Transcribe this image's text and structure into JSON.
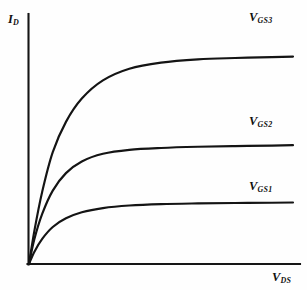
{
  "figure": {
    "background_color": "#fefefe",
    "line_color": "#141414"
  },
  "axes": {
    "y_label_base": "I",
    "y_label_sub": "D",
    "x_label_base": "V",
    "x_label_sub": "DS"
  },
  "curve_labels": [
    {
      "base": "V",
      "sub": "GS1"
    },
    {
      "base": "V",
      "sub": "GS2"
    },
    {
      "base": "V",
      "sub": "GS3"
    }
  ],
  "chart_data": {
    "type": "line",
    "title": "",
    "xlabel": "V_DS",
    "ylabel": "I_D",
    "xlim": [
      0,
      100
    ],
    "ylim": [
      0,
      100
    ],
    "grid": false,
    "legend": "inline-right-of-curve",
    "axis_ticks": false,
    "series": [
      {
        "name": "V_GS1",
        "saturation_level": 26,
        "x": [
          0,
          2,
          5,
          9,
          14,
          20,
          28,
          38,
          50,
          64,
          78,
          92,
          100
        ],
        "y": [
          0,
          5.2,
          10.8,
          15.9,
          19.6,
          22.2,
          24.0,
          25.1,
          25.7,
          26.0,
          26.2,
          26.3,
          26.4
        ]
      },
      {
        "name": "V_GS2",
        "saturation_level": 50,
        "x": [
          0,
          2,
          5,
          9,
          14,
          20,
          28,
          38,
          50,
          64,
          78,
          92,
          100
        ],
        "y": [
          0,
          10.5,
          21.5,
          31.5,
          39.0,
          44.0,
          47.3,
          49.0,
          49.8,
          50.3,
          50.6,
          50.8,
          51.0
        ]
      },
      {
        "name": "V_GS3",
        "saturation_level": 89,
        "x": [
          0,
          2,
          5,
          9,
          14,
          20,
          28,
          38,
          50,
          64,
          78,
          92,
          100
        ],
        "y": [
          0,
          14.0,
          31.0,
          48.0,
          61.0,
          71.0,
          78.8,
          83.8,
          86.4,
          87.8,
          88.4,
          88.8,
          89.0
        ]
      }
    ]
  }
}
